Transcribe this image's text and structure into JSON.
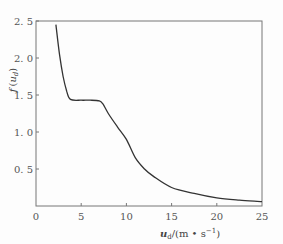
{
  "chart_data": {
    "type": "line",
    "title": "",
    "xlabel": "u_d/(m·s⁻¹)",
    "ylabel": "f(u_d)",
    "xlim": [
      0,
      25
    ],
    "ylim": [
      0,
      2.5
    ],
    "grid": false,
    "legend": null,
    "x_ticks": [
      "0",
      "5",
      "10",
      "15",
      "20",
      "25"
    ],
    "y_ticks": [
      "0.5",
      "1.0",
      "1.5",
      "2.0",
      "2.5"
    ],
    "series": [
      {
        "name": "f(u_d)",
        "x": [
          2.2,
          2.6,
          3.0,
          3.4,
          3.8,
          5.0,
          6.0,
          7.0,
          7.4,
          8.0,
          9.0,
          10.0,
          11.0,
          12.0,
          13.0,
          15.0,
          17.5,
          20.0,
          22.5,
          25.0
        ],
        "values": [
          2.45,
          2.05,
          1.75,
          1.55,
          1.44,
          1.43,
          1.43,
          1.42,
          1.38,
          1.25,
          1.07,
          0.9,
          0.65,
          0.5,
          0.4,
          0.25,
          0.17,
          0.11,
          0.08,
          0.06
        ]
      }
    ]
  },
  "labels": {
    "y_axis_f": "f",
    "y_axis_open": "(",
    "y_axis_u": "u",
    "y_axis_sub": "d",
    "y_axis_close": ")",
    "x_axis_u": "u",
    "x_axis_sub": "d",
    "x_axis_unit": "/(m • s",
    "x_axis_exp": "−1",
    "x_axis_close": ")"
  },
  "style": {
    "line_color": "#333333",
    "frame_color": "#777777"
  }
}
